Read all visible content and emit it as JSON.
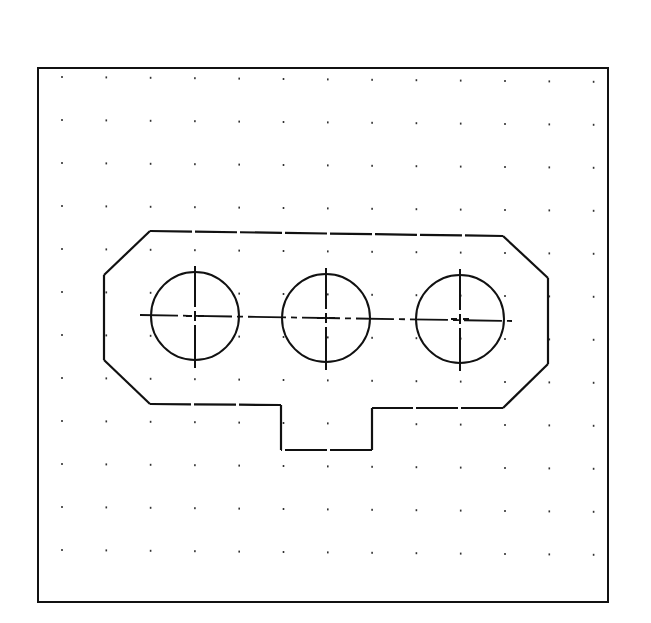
{
  "drawing": {
    "type": "cad-sketch",
    "frame": {
      "x1": 38,
      "y1": 68,
      "x2": 608,
      "y2": 602,
      "stroke": "#111111"
    },
    "grid": {
      "x0": 62,
      "y0": 77,
      "dx": 44.3,
      "dy": 43.0,
      "cols": 13,
      "rows": 12,
      "dot_color": "#333333"
    },
    "outline": {
      "points": [
        [
          150,
          231
        ],
        [
          503,
          236
        ],
        [
          548,
          278
        ],
        [
          548,
          364
        ],
        [
          503,
          408
        ],
        [
          372,
          408
        ],
        [
          372,
          450
        ],
        [
          281,
          450
        ],
        [
          281,
          405
        ],
        [
          150,
          404
        ],
        [
          104,
          360
        ],
        [
          104,
          275
        ]
      ],
      "stroke": "#111111",
      "dashed_edges": true
    },
    "holes": [
      {
        "id": "hole-left",
        "cx": 195,
        "cy": 316,
        "r": 44
      },
      {
        "id": "hole-center",
        "cx": 326,
        "cy": 318,
        "r": 44
      },
      {
        "id": "hole-right",
        "cx": 460,
        "cy": 319,
        "r": 44
      }
    ],
    "centerline": {
      "x1": 140,
      "y1": 315,
      "x2": 512,
      "y2": 321
    },
    "stroke_color": "#111111"
  }
}
